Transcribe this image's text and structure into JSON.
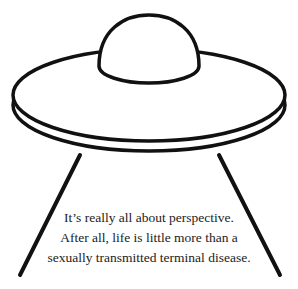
{
  "illustration": {
    "subject": "ufo-icon",
    "stroke_color": "#111111",
    "fill_color": "#ffffff"
  },
  "caption": {
    "lines": [
      "It’s really all about perspective.",
      "After all, life is little more than a",
      "sexually transmitted terminal disease."
    ]
  }
}
